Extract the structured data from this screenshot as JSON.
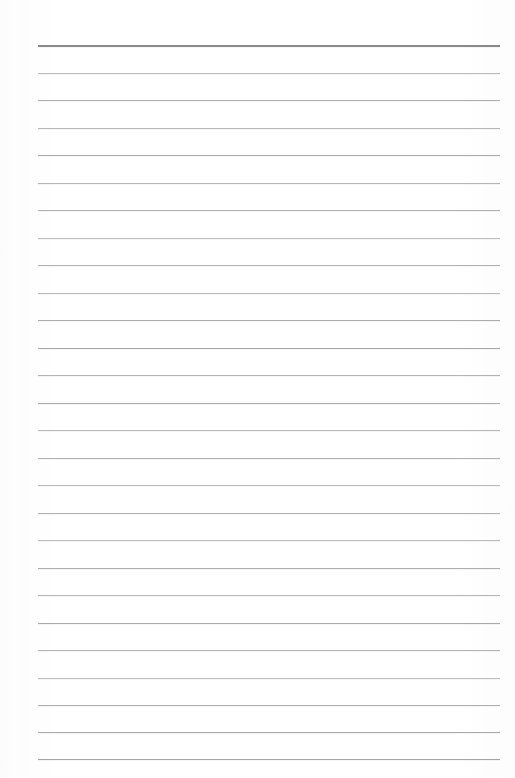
{
  "page": {
    "kind": "scanned-ruled-notebook-page",
    "width": 515,
    "height": 778,
    "background_color": "#ffffff",
    "text_content": "",
    "annotation": "blank lined page, no writing"
  },
  "ruling": {
    "line_count": 27,
    "left_x": 38,
    "right_x": 500,
    "first_line_y": 45,
    "line_spacing": 27.5,
    "default_color": "#b3b3b3",
    "header_line_color": "#8a8a8a",
    "header_line_thickness": 2,
    "default_thickness": 1,
    "lines": [
      {
        "y": 45,
        "color": "#8a8a8a",
        "thickness": 2,
        "left": 38,
        "right": 500
      },
      {
        "y": 72.5,
        "color": "#bcbcbc",
        "thickness": 1,
        "left": 38,
        "right": 500
      },
      {
        "y": 100,
        "color": "#b0b0b0",
        "thickness": 1,
        "left": 38,
        "right": 500
      },
      {
        "y": 127.5,
        "color": "#b8b8b8",
        "thickness": 1,
        "left": 38,
        "right": 500
      },
      {
        "y": 155,
        "color": "#ababab",
        "thickness": 1,
        "left": 38,
        "right": 500
      },
      {
        "y": 182.5,
        "color": "#b6b6b6",
        "thickness": 1,
        "left": 38,
        "right": 500
      },
      {
        "y": 210,
        "color": "#b0b0b0",
        "thickness": 1,
        "left": 38,
        "right": 500
      },
      {
        "y": 237.5,
        "color": "#bdbdbd",
        "thickness": 1,
        "left": 38,
        "right": 500
      },
      {
        "y": 265,
        "color": "#b2b2b2",
        "thickness": 1,
        "left": 38,
        "right": 500
      },
      {
        "y": 292.5,
        "color": "#bababa",
        "thickness": 1,
        "left": 38,
        "right": 500
      },
      {
        "y": 320,
        "color": "#adadad",
        "thickness": 1,
        "left": 38,
        "right": 500
      },
      {
        "y": 347.5,
        "color": "#a8a8a8",
        "thickness": 1,
        "left": 38,
        "right": 500
      },
      {
        "y": 375,
        "color": "#b5b5b5",
        "thickness": 1,
        "left": 38,
        "right": 500
      },
      {
        "y": 402.5,
        "color": "#acacac",
        "thickness": 1,
        "left": 38,
        "right": 500
      },
      {
        "y": 430,
        "color": "#b7b7b7",
        "thickness": 1,
        "left": 38,
        "right": 500
      },
      {
        "y": 457.5,
        "color": "#b1b1b1",
        "thickness": 1,
        "left": 38,
        "right": 500
      },
      {
        "y": 485,
        "color": "#bcbcbc",
        "thickness": 1,
        "left": 38,
        "right": 500
      },
      {
        "y": 512.5,
        "color": "#b3b3b3",
        "thickness": 1,
        "left": 38,
        "right": 500
      },
      {
        "y": 540,
        "color": "#bbbbbb",
        "thickness": 1,
        "left": 38,
        "right": 500
      },
      {
        "y": 567.5,
        "color": "#aeaeae",
        "thickness": 1,
        "left": 38,
        "right": 500
      },
      {
        "y": 595,
        "color": "#b6b6b6",
        "thickness": 1,
        "left": 38,
        "right": 500
      },
      {
        "y": 622.5,
        "color": "#aaaaaa",
        "thickness": 1,
        "left": 38,
        "right": 500
      },
      {
        "y": 650,
        "color": "#b4b4b4",
        "thickness": 1,
        "left": 38,
        "right": 500
      },
      {
        "y": 677.5,
        "color": "#bdbdbd",
        "thickness": 1,
        "left": 38,
        "right": 500
      },
      {
        "y": 705,
        "color": "#b0b0b0",
        "thickness": 1,
        "left": 38,
        "right": 500
      },
      {
        "y": 732,
        "color": "#a9a9a9",
        "thickness": 1,
        "left": 38,
        "right": 500
      },
      {
        "y": 759,
        "color": "#a5a5a5",
        "thickness": 1,
        "left": 38,
        "right": 500
      }
    ]
  }
}
